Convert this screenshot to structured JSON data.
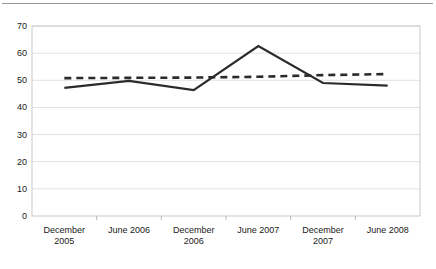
{
  "chart_data": {
    "type": "line",
    "title": "",
    "subtitle": "",
    "xlabel": "",
    "ylabel": "",
    "categories": [
      "December 2005",
      "June 2006",
      "December 2006",
      "June 2007",
      "December 2007",
      "June 2008"
    ],
    "x_tick_labels_line1": [
      "December",
      "June 2006",
      "December",
      "June 2007",
      "December",
      "June 2008"
    ],
    "x_tick_labels_line2": [
      "2005",
      "",
      "2006",
      "",
      "2007",
      ""
    ],
    "y_tick_labels": [
      "0",
      "10",
      "20",
      "30",
      "40",
      "50",
      "60",
      "70"
    ],
    "y_ticks": [
      0,
      10,
      20,
      30,
      40,
      50,
      60,
      70
    ],
    "ylim": [
      0,
      70
    ],
    "grid": true,
    "grid_axis": "y",
    "legend": "none",
    "series": [
      {
        "name": "solid-series",
        "style": "solid",
        "color": "#2b2b2b",
        "values": [
          47.2,
          49.8,
          46.4,
          62.6,
          49.0,
          48.0
        ]
      },
      {
        "name": "dashed-series",
        "style": "dashed",
        "color": "#2b2b2b",
        "values": [
          50.8,
          50.9,
          51.0,
          51.3,
          51.9,
          52.3
        ]
      }
    ]
  },
  "axes": {
    "plot_left": 32,
    "plot_right": 420,
    "plot_top": 26,
    "plot_bottom": 216
  }
}
